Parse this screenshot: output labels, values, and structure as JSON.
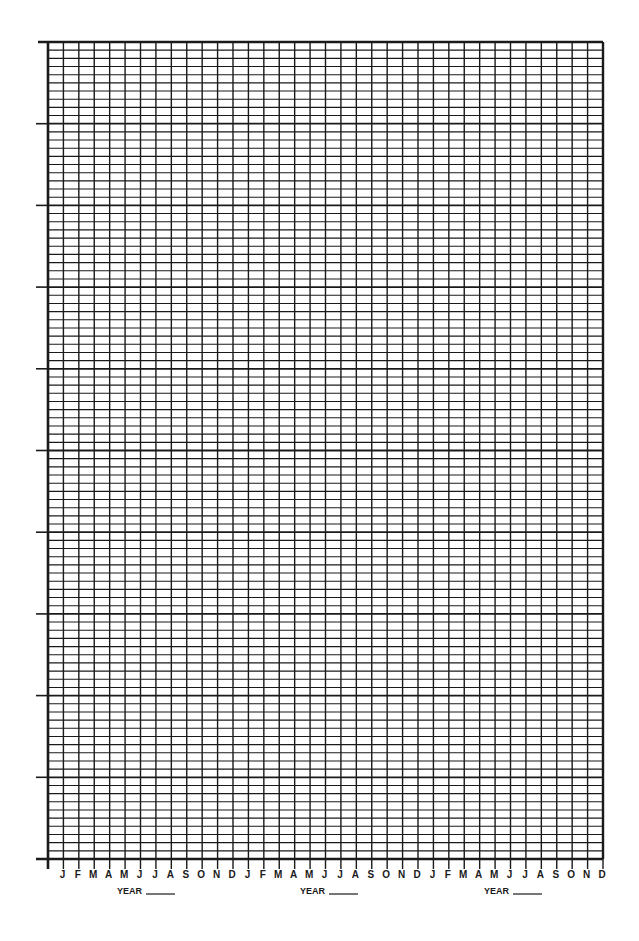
{
  "chart_data": {
    "type": "line",
    "title": "",
    "xlabel": "",
    "ylabel": "",
    "categories": [
      "J",
      "F",
      "M",
      "A",
      "M",
      "J",
      "J",
      "A",
      "S",
      "O",
      "N",
      "D",
      "J",
      "F",
      "M",
      "A",
      "M",
      "J",
      "J",
      "A",
      "S",
      "O",
      "N",
      "D",
      "J",
      "F",
      "M",
      "A",
      "M",
      "J",
      "J",
      "A",
      "S",
      "O",
      "N",
      "D"
    ],
    "series": [],
    "years": [
      {
        "label": "YEAR",
        "value": ""
      },
      {
        "label": "YEAR",
        "value": ""
      },
      {
        "label": "YEAR",
        "value": ""
      }
    ],
    "grid": true,
    "y_major_divisions": 10,
    "y_minor_per_major": 10,
    "x_columns": 36,
    "y_tick_labels": [],
    "legend": null
  },
  "colors": {
    "grid": "#1a1a1a",
    "background": "#ffffff"
  }
}
